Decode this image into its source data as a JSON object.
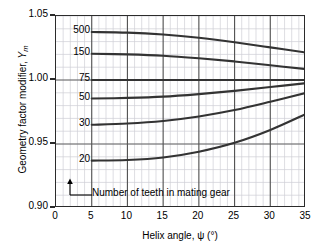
{
  "chart_data": {
    "type": "line",
    "title": "",
    "xlabel": "Helix angle, ψ (°)",
    "ylabel": "Geometry factor modifier, Ym",
    "ylabel_main": "Geometry factor modifier, ",
    "ylabel_var": "Y",
    "ylabel_sub": "m",
    "xlim": [
      0,
      35
    ],
    "ylim": [
      0.9,
      1.05
    ],
    "xticks": [
      "0",
      "5",
      "10",
      "15",
      "20",
      "25",
      "30",
      "35"
    ],
    "xtick_values": [
      0,
      5,
      10,
      15,
      20,
      25,
      30,
      35
    ],
    "yticks": [
      "1.05",
      "1.00",
      "0.95",
      "0.90"
    ],
    "ytick_values": [
      1.05,
      1.0,
      0.95,
      0.9
    ],
    "grid": true,
    "grid_major_x_step": 5,
    "grid_minor_x_step": 1,
    "grid_major_y_step": 0.05,
    "grid_minor_y_step": 0.01,
    "legend_position": "inline-curve-labels",
    "annotation": "Number of teeth in mating gear",
    "series_label_title": "Number of teeth in mating gear",
    "x": [
      5,
      10,
      15,
      20,
      25,
      30,
      35
    ],
    "series": [
      {
        "name": "500",
        "label": "500",
        "values": [
          1.0375,
          1.037,
          1.0355,
          1.033,
          1.0295,
          1.0255,
          1.0215
        ],
        "label_y": 1.0375
      },
      {
        "name": "150",
        "label": "150",
        "values": [
          1.0205,
          1.02,
          1.019,
          1.017,
          1.0145,
          1.0115,
          1.0085
        ],
        "label_y": 1.0205
      },
      {
        "name": "75",
        "label": "75",
        "values": [
          1.0,
          1.0,
          1.0,
          1.0,
          1.0,
          1.0,
          1.0
        ],
        "label_y": 1.0
      },
      {
        "name": "50",
        "label": "50",
        "values": [
          0.9855,
          0.986,
          0.987,
          0.989,
          0.9915,
          0.9945,
          0.9975
        ],
        "label_y": 0.9855
      },
      {
        "name": "30",
        "label": "30",
        "values": [
          0.965,
          0.966,
          0.968,
          0.9715,
          0.9765,
          0.983,
          0.99
        ],
        "label_y": 0.965
      },
      {
        "name": "20",
        "label": "20",
        "values": [
          0.937,
          0.9375,
          0.9395,
          0.944,
          0.951,
          0.961,
          0.9735
        ],
        "label_y": 0.937
      }
    ],
    "colors": {
      "curve": "#333333",
      "frame": "#2b2b2b",
      "grid_major": "#555555",
      "grid_minor": "#cfcfd6",
      "text": "#000000",
      "background": "#ffffff"
    }
  }
}
